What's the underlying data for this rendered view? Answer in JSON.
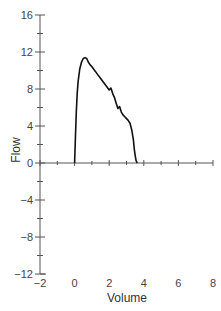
{
  "chart_data": {
    "type": "line",
    "title": "",
    "xlabel": "Volume",
    "ylabel": "Flow",
    "xlim": [
      -2,
      8
    ],
    "ylim": [
      -12,
      16
    ],
    "xticks": [
      -2,
      0,
      2,
      4,
      6,
      8
    ],
    "yticks": [
      -12,
      -8,
      -4,
      0,
      4,
      8,
      12,
      16
    ],
    "grid": false,
    "legend": null,
    "series": [
      {
        "name": "flow-volume curve",
        "color": "#111111",
        "x": [
          0.0,
          0.05,
          0.1,
          0.15,
          0.2,
          0.3,
          0.4,
          0.5,
          0.6,
          0.7,
          0.8,
          0.9,
          1.0,
          1.2,
          1.4,
          1.6,
          1.8,
          2.0,
          2.1,
          2.2,
          2.3,
          2.4,
          2.5,
          2.6,
          2.7,
          2.8,
          2.9,
          3.0,
          3.1,
          3.2,
          3.3,
          3.4,
          3.45,
          3.5,
          3.55,
          3.6,
          3.62
        ],
        "y": [
          0.0,
          3.0,
          5.5,
          7.5,
          8.8,
          10.2,
          10.9,
          11.3,
          11.4,
          11.3,
          10.9,
          10.6,
          10.4,
          9.9,
          9.4,
          8.9,
          8.4,
          7.9,
          8.1,
          7.5,
          7.1,
          6.5,
          5.9,
          6.1,
          5.5,
          5.2,
          5.0,
          4.8,
          4.6,
          4.3,
          3.6,
          2.5,
          1.5,
          0.8,
          0.3,
          0.05,
          0.0
        ]
      }
    ]
  }
}
